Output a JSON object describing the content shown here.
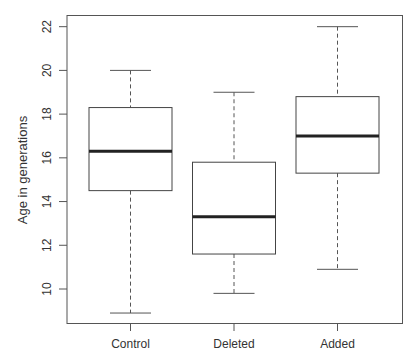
{
  "chart_data": {
    "type": "boxplot",
    "title": "",
    "xlabel": "",
    "ylabel": "Age in generations",
    "ylim": [
      8.5,
      22.5
    ],
    "yticks": [
      10,
      12,
      14,
      16,
      18,
      20,
      22
    ],
    "ytick_labels": [
      "10",
      "12",
      "14",
      "16",
      "18",
      "20",
      "22"
    ],
    "grid": false,
    "legend": null,
    "categories": [
      "Control",
      "Deleted",
      "Added"
    ],
    "series": [
      {
        "name": "Control",
        "whisker_low": 8.9,
        "q1": 14.5,
        "median": 16.3,
        "q3": 18.3,
        "whisker_high": 20.0
      },
      {
        "name": "Deleted",
        "whisker_low": 9.8,
        "q1": 11.6,
        "median": 13.3,
        "q3": 15.8,
        "whisker_high": 19.0
      },
      {
        "name": "Added",
        "whisker_low": 10.9,
        "q1": 15.3,
        "median": 17.0,
        "q3": 18.8,
        "whisker_high": 22.0
      }
    ]
  },
  "colors": {
    "axis": "#555555",
    "box": "#444444",
    "median": "#222222",
    "whisker": "#555555",
    "text": "#333333"
  }
}
